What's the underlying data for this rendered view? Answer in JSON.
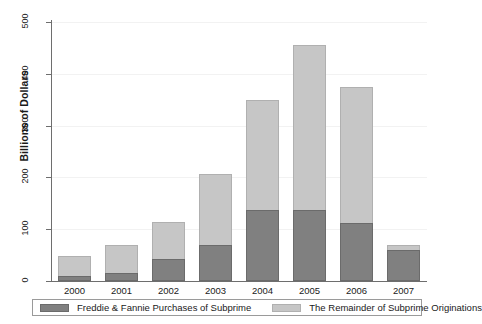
{
  "chart_data": {
    "type": "bar",
    "subtype": "stacked-vertical",
    "title": "",
    "xlabel": "",
    "ylabel": "Billions of Dollars",
    "categories": [
      "2000",
      "2001",
      "2002",
      "2003",
      "2004",
      "2005",
      "2006",
      "2007"
    ],
    "series": [
      {
        "name": "Freddie & Fannie Purchases of Subprime",
        "color": "#808080",
        "values": [
          10,
          15,
          43,
          70,
          137,
          137,
          112,
          60
        ]
      },
      {
        "name": "The Remainder of Subprime Originations",
        "color": "#c6c6c6",
        "values": [
          38,
          55,
          71,
          137,
          213,
          318,
          263,
          10
        ]
      }
    ],
    "totals": [
      48,
      70,
      114,
      207,
      350,
      455,
      375,
      70
    ],
    "ylim": [
      0,
      500
    ],
    "yticks": [
      0,
      100,
      200,
      300,
      400,
      500
    ],
    "ytick_labels": [
      "0",
      "100",
      "200",
      "300",
      "400",
      "500"
    ],
    "grid": true,
    "grid_axis": "y",
    "legend_position": "bottom"
  },
  "axis": {
    "y_title": "Billions of Dollars"
  },
  "legend": {
    "entries": [
      {
        "label": "Freddie & Fannie Purchases of Subprime",
        "color": "#808080"
      },
      {
        "label": "The Remainder of Subprime Originations",
        "color": "#c6c6c6"
      }
    ]
  }
}
